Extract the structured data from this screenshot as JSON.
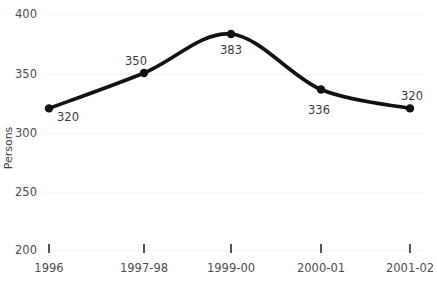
{
  "chart_data": {
    "type": "line",
    "title": "",
    "xlabel": "",
    "ylabel": "Persons",
    "categories": [
      "1996",
      "1997-98",
      "1999-00",
      "2000-01",
      "2001-02"
    ],
    "values": [
      320,
      350,
      383,
      336,
      320
    ],
    "point_labels": [
      "320",
      "350",
      "383",
      "336",
      "320"
    ],
    "ylim": [
      200,
      400
    ],
    "yticks": [
      200,
      250,
      300,
      350,
      400
    ],
    "ytick_labels": [
      "200",
      "250",
      "300",
      "350",
      "400"
    ],
    "grid": true,
    "legend": "none",
    "series": [
      {
        "name": "Persons",
        "values": [
          320,
          350,
          383,
          336,
          320
        ],
        "color": "#111111"
      }
    ],
    "colors": {
      "line": "#111111",
      "marker": "#111111",
      "grid": "#dedede",
      "text": "#4d4d4d",
      "background": "#ffffff"
    }
  },
  "axis": {
    "y_label": "Persons",
    "y_ticks": [
      "400",
      "350",
      "300",
      "250",
      "200"
    ],
    "x_ticks": [
      "1996",
      "1997-98",
      "1999-00",
      "2000-01",
      "2001-02"
    ]
  },
  "labels": {
    "p0": "320",
    "p1": "350",
    "p2": "383",
    "p3": "336",
    "p4": "320"
  }
}
